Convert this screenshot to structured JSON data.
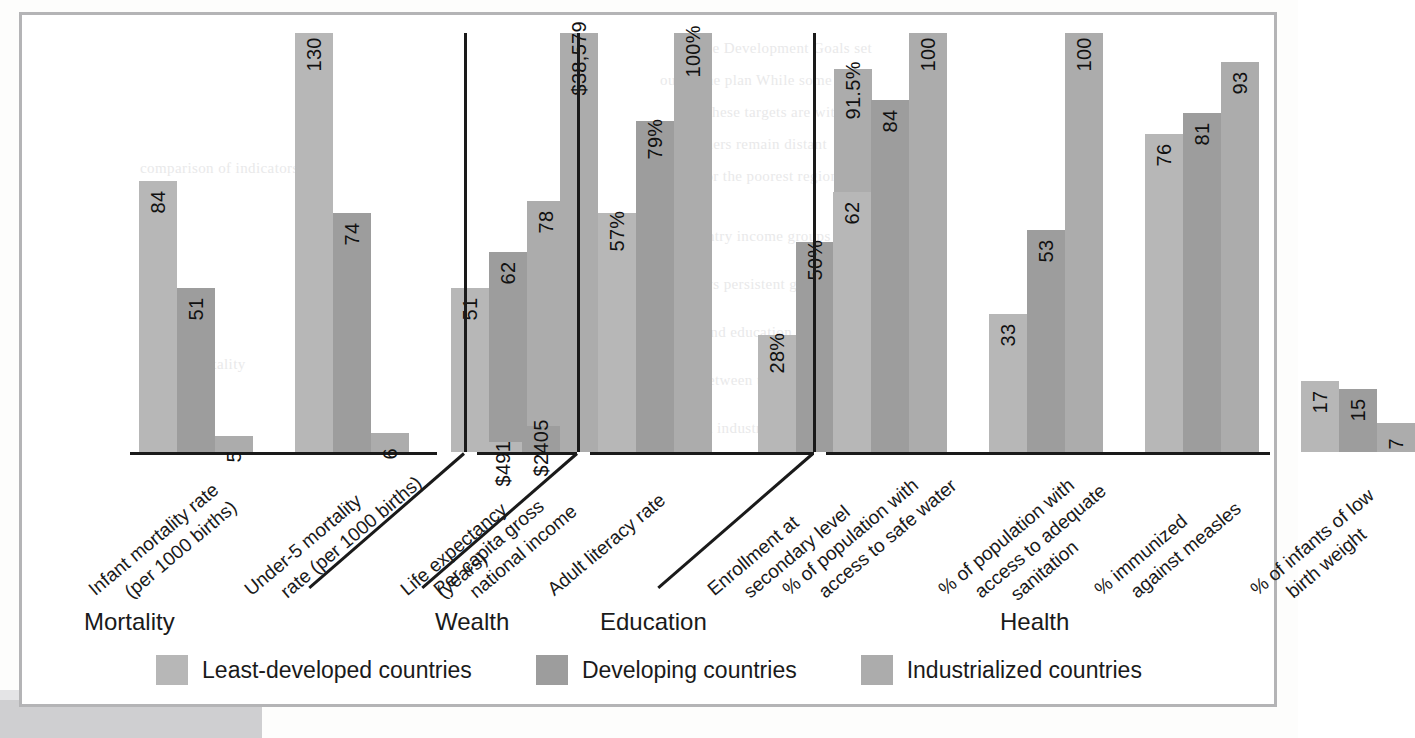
{
  "chart_data": {
    "type": "bar",
    "title": "",
    "xlabel": "",
    "ylabel": "",
    "grid": false,
    "legend_position": "bottom",
    "series": [
      {
        "name": "Least-developed countries",
        "color": "#b7b7b7"
      },
      {
        "name": "Developing countries",
        "color": "#9d9d9d"
      },
      {
        "name": "Industrialized countries",
        "color": "#acacac"
      }
    ],
    "groups": [
      {
        "name": "Mortality",
        "categories": [
          {
            "label_line1": "Infant mortality rate",
            "label_line2": "(per 1000 births)",
            "values": [
              84,
              51,
              5
            ],
            "labels": [
              "84",
              "51",
              "5"
            ]
          },
          {
            "label_line1": "Under-5 mortality",
            "label_line2": "rate (per 1000 births)",
            "values": [
              130,
              74,
              6
            ],
            "labels": [
              "130",
              "74",
              "6"
            ]
          },
          {
            "label_line1": "Life expectancy",
            "label_line2": "(years)",
            "values": [
              51,
              62,
              78
            ],
            "labels": [
              "51",
              "62",
              "78"
            ]
          }
        ]
      },
      {
        "name": "Wealth",
        "categories": [
          {
            "label_line1": "Per capita gross",
            "label_line2": "national income",
            "values": [
              491,
              2405,
              38579
            ],
            "labels": [
              "$491",
              "$2405",
              "$38,579"
            ]
          }
        ]
      },
      {
        "name": "Education",
        "categories": [
          {
            "label_line1": "Adult literacy rate",
            "label_line2": "",
            "values": [
              57,
              79,
              100
            ],
            "labels": [
              "57%",
              "79%",
              "100%"
            ]
          },
          {
            "label_line1": "Enrollment at",
            "label_line2": "secondary level",
            "values": [
              28,
              50,
              91.5
            ],
            "labels": [
              "28%",
              "50%",
              "91.5%"
            ]
          }
        ]
      },
      {
        "name": "Health",
        "categories": [
          {
            "label_line1": "% of population with",
            "label_line2": "access to safe water",
            "values": [
              62,
              84,
              100
            ],
            "labels": [
              "62",
              "84",
              "100"
            ]
          },
          {
            "label_line1": "% of population with",
            "label_line2": "access to adequate",
            "label_line3": "sanitation",
            "values": [
              33,
              53,
              100
            ],
            "labels": [
              "33",
              "53",
              "100"
            ]
          },
          {
            "label_line1": "% immunized",
            "label_line2": "against measles",
            "values": [
              76,
              81,
              93
            ],
            "labels": [
              "76",
              "81",
              "93"
            ]
          },
          {
            "label_line1": "% of infants of low",
            "label_line2": "birth weight",
            "values": [
              17,
              15,
              7
            ],
            "labels": [
              "17",
              "15",
              "7"
            ]
          }
        ]
      }
    ]
  },
  "legend": {
    "items": [
      {
        "label": "Least-developed countries",
        "swatch": "s0"
      },
      {
        "label": "Developing countries",
        "swatch": "s1"
      },
      {
        "label": "Industrialized countries",
        "swatch": "s2"
      }
    ]
  },
  "colors": {
    "series_least_developed": "#b7b7b7",
    "series_developing": "#9d9d9d",
    "series_industrialized": "#acacac",
    "axis": "#1a1a1a",
    "frame": "#b4b4b6"
  }
}
